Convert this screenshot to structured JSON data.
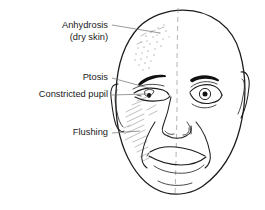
{
  "figure": {
    "background_color": "#ffffff",
    "line_color": "#1b1b1b",
    "label_color": "#1b1b1b",
    "leader_color": "#6f6f6f",
    "midline_color": "#9a9a9a",
    "shading_color": "#b4b4b4"
  },
  "labels": {
    "anhydrosis": {
      "line1": "Anhydrosis",
      "line2": "(dry skin)"
    },
    "ptosis": "Ptosis",
    "constricted_pupil": "Constricted pupil",
    "flushing": "Flushing"
  },
  "annotations": [
    {
      "name": "anhydrosis",
      "text": "Anhydrosis (dry skin)",
      "target": "forehead-stipple"
    },
    {
      "name": "ptosis",
      "text": "Ptosis",
      "target": "drooping-eyelid"
    },
    {
      "name": "constricted-pupil",
      "text": "Constricted pupil",
      "target": "affected-pupil"
    },
    {
      "name": "flushing",
      "text": "Flushing",
      "target": "cheek-hatching"
    }
  ],
  "illustration": {
    "subject": "bald male face, frontal view",
    "midline": "vertical dashed line dividing face",
    "affected_side": "viewer-left",
    "features": [
      "head-outline",
      "left-ear",
      "right-ear",
      "left-eyebrow",
      "right-eyebrow",
      "affected-eye-ptosis",
      "normal-eye",
      "nose",
      "mouth",
      "chin",
      "nasolabial-folds",
      "forehead-stipple",
      "cheek-hatching"
    ]
  }
}
